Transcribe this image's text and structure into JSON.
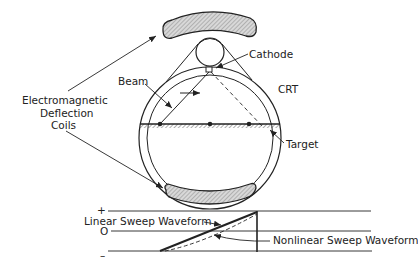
{
  "diagram": {
    "labels": {
      "coils_line1": "Electromagnetic",
      "coils_line2": "Deflection",
      "coils_line3": "Coils",
      "beam": "Beam",
      "cathode": "Cathode",
      "crt": "CRT",
      "target": "Target",
      "linear_sweep": "Linear Sweep Waveform",
      "nonlinear_sweep": "Nonlinear Sweep Waveform"
    },
    "waveform_axis": {
      "plus": "+",
      "zero": "O",
      "minus": "–"
    },
    "colors": {
      "line": "#222222",
      "coil_fill": "#cfcfcf",
      "background": "#ffffff"
    }
  }
}
